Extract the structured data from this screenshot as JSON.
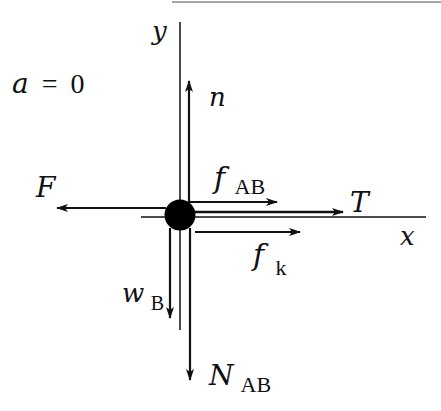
{
  "diagram": {
    "type": "free-body-diagram",
    "condition": {
      "variable": "a",
      "equals": "=",
      "value": "0"
    },
    "axes": {
      "x": {
        "label": "x"
      },
      "y": {
        "label": "y"
      }
    },
    "body": {
      "shape": "filled-circle",
      "color": "#000000"
    },
    "forces": [
      {
        "id": "n",
        "symbol": "n",
        "subscript": "",
        "direction": "up"
      },
      {
        "id": "F",
        "symbol": "F",
        "subscript": "",
        "direction": "left"
      },
      {
        "id": "f_AB",
        "symbol": "f",
        "subscript": "AB",
        "direction": "right"
      },
      {
        "id": "T",
        "symbol": "T",
        "subscript": "",
        "direction": "right"
      },
      {
        "id": "f_k",
        "symbol": "f",
        "subscript": "k",
        "direction": "right"
      },
      {
        "id": "w_B",
        "symbol": "w",
        "subscript": "B",
        "direction": "down"
      },
      {
        "id": "N_AB",
        "symbol": "N",
        "subscript": "AB",
        "direction": "down"
      }
    ],
    "colors": {
      "ink": "#111111",
      "background": "#ffffff"
    }
  }
}
